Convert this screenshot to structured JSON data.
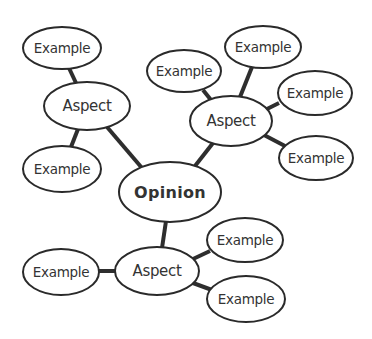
{
  "diagram": {
    "type": "mind-map",
    "colors": {
      "background": "#ffffff",
      "edge": "#2e2e2e",
      "node_stroke": "#2a2a2a",
      "node_fill": "#ffffff",
      "text": "#333333"
    },
    "nodes": [
      {
        "id": "opinion",
        "label": "Opinion",
        "kind": "root",
        "cx": 170,
        "cy": 192,
        "rx": 51,
        "ry": 30
      },
      {
        "id": "aspect-left",
        "label": "Aspect",
        "kind": "aspect",
        "cx": 87,
        "cy": 106,
        "rx": 43,
        "ry": 24
      },
      {
        "id": "aspect-right",
        "label": "Aspect",
        "kind": "aspect",
        "cx": 231,
        "cy": 121,
        "rx": 41,
        "ry": 25
      },
      {
        "id": "aspect-bottom",
        "label": "Aspect",
        "kind": "aspect",
        "cx": 157,
        "cy": 271,
        "rx": 42,
        "ry": 24
      },
      {
        "id": "example-1",
        "label": "Example",
        "kind": "example",
        "cx": 62,
        "cy": 48,
        "rx": 39,
        "ry": 21
      },
      {
        "id": "example-2",
        "label": "Example",
        "kind": "example",
        "cx": 62,
        "cy": 169,
        "rx": 39,
        "ry": 23
      },
      {
        "id": "example-3",
        "label": "Example",
        "kind": "example",
        "cx": 184,
        "cy": 71,
        "rx": 37,
        "ry": 21
      },
      {
        "id": "example-4",
        "label": "Example",
        "kind": "example",
        "cx": 263,
        "cy": 47,
        "rx": 38,
        "ry": 21
      },
      {
        "id": "example-5",
        "label": "Example",
        "kind": "example",
        "cx": 315,
        "cy": 93,
        "rx": 37,
        "ry": 22
      },
      {
        "id": "example-6",
        "label": "Example",
        "kind": "example",
        "cx": 316,
        "cy": 158,
        "rx": 37,
        "ry": 22
      },
      {
        "id": "example-7",
        "label": "Example",
        "kind": "example",
        "cx": 61,
        "cy": 272,
        "rx": 38,
        "ry": 23
      },
      {
        "id": "example-8",
        "label": "Example",
        "kind": "example",
        "cx": 245,
        "cy": 240,
        "rx": 38,
        "ry": 22
      },
      {
        "id": "example-9",
        "label": "Example",
        "kind": "example",
        "cx": 246,
        "cy": 299,
        "rx": 39,
        "ry": 23
      }
    ],
    "edges": [
      {
        "from": "opinion",
        "to": "aspect-left"
      },
      {
        "from": "opinion",
        "to": "aspect-right"
      },
      {
        "from": "opinion",
        "to": "aspect-bottom"
      },
      {
        "from": "aspect-left",
        "to": "example-1"
      },
      {
        "from": "aspect-left",
        "to": "example-2"
      },
      {
        "from": "aspect-right",
        "to": "example-3"
      },
      {
        "from": "aspect-right",
        "to": "example-4"
      },
      {
        "from": "aspect-right",
        "to": "example-5"
      },
      {
        "from": "aspect-right",
        "to": "example-6"
      },
      {
        "from": "aspect-bottom",
        "to": "example-7"
      },
      {
        "from": "aspect-bottom",
        "to": "example-8"
      },
      {
        "from": "aspect-bottom",
        "to": "example-9"
      }
    ]
  }
}
